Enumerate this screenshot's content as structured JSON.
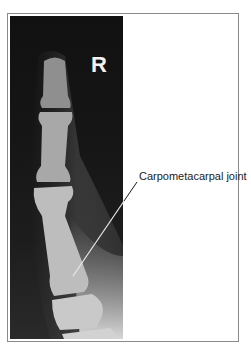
{
  "figure": {
    "side_marker": "R",
    "annotation": {
      "label": "Carpometacarpal joint",
      "pointer_from": [
        137,
        182
      ],
      "pointer_to": [
        73,
        276
      ]
    },
    "colors": {
      "frame": "#8a8a8a",
      "background": "#ffffff",
      "xray_dark": "#111111",
      "bone": "#c8c8c8",
      "label_text": "#222222"
    }
  }
}
